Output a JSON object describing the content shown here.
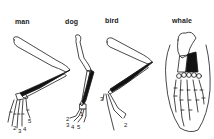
{
  "diagram": {
    "type": "homologous-forelimbs",
    "panels": [
      {
        "id": "man",
        "label": "man",
        "digit_labels": [
          "1",
          "2",
          "3",
          "4",
          "5"
        ]
      },
      {
        "id": "dog",
        "label": "dog",
        "digit_labels": [
          "1",
          "2",
          "3",
          "4",
          "5"
        ]
      },
      {
        "id": "bird",
        "label": "bird",
        "digit_labels": [
          "2",
          "3"
        ]
      },
      {
        "id": "whale",
        "label": "whale",
        "digit_labels": []
      }
    ],
    "colors": {
      "outline": "#1a1a1a",
      "fill_dark": "#111111",
      "background": "#ffffff"
    }
  }
}
